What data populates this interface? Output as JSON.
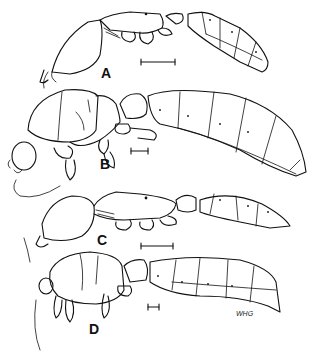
{
  "figure": {
    "type": "scientific line drawing",
    "panels": [
      {
        "label": "A",
        "scale_bar_length_px": 35
      },
      {
        "label": "B",
        "scale_bar_length_px": 18
      },
      {
        "label": "C",
        "scale_bar_length_px": 33
      },
      {
        "label": "D",
        "scale_bar_length_px": 12
      }
    ],
    "artist_signature": "WHG"
  }
}
